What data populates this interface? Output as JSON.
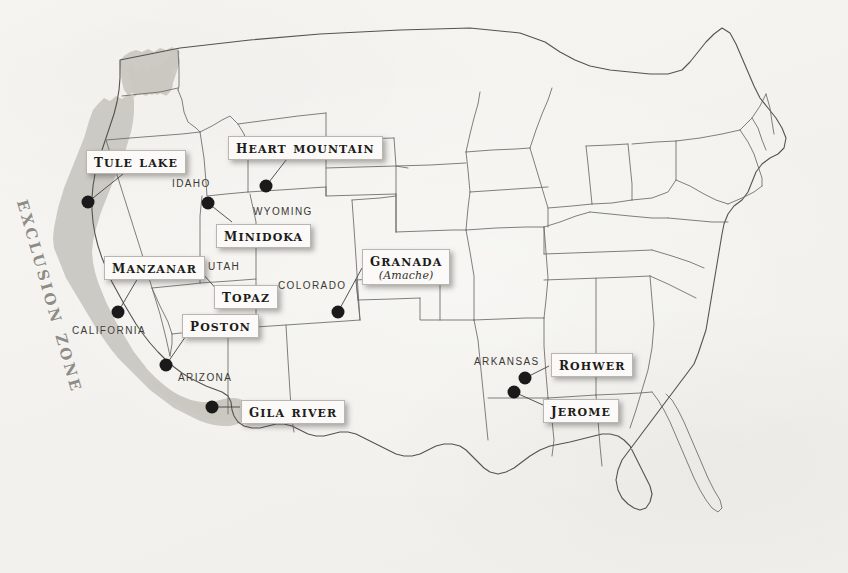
{
  "map": {
    "title": "Japanese American Incarceration Camps and West Coast Exclusion Zone",
    "background_color": "#f5f4f1",
    "outline_color": "#5a5853",
    "zone_fill_color": "#c9c7c1",
    "dot_color": "#1a1a1a",
    "exclusion_zone_label": "Exclusion Zone"
  },
  "camps": [
    {
      "name": "Tule Lake",
      "subtitle": "",
      "label_x": 86,
      "label_y": 150,
      "dot_x": 88,
      "dot_y": 202
    },
    {
      "name": "Heart Mountain",
      "subtitle": "",
      "label_x": 228,
      "label_y": 136,
      "dot_x": 266,
      "dot_y": 186
    },
    {
      "name": "Minidoka",
      "subtitle": "",
      "label_x": 216,
      "label_y": 224,
      "dot_x": 208,
      "dot_y": 203
    },
    {
      "name": "Manzanar",
      "subtitle": "",
      "label_x": 104,
      "label_y": 256,
      "dot_x": 118,
      "dot_y": 312
    },
    {
      "name": "Topaz",
      "subtitle": "",
      "label_x": 214,
      "label_y": 285,
      "dot_x": 195,
      "dot_y": 265
    },
    {
      "name": "Poston",
      "subtitle": "",
      "label_x": 182,
      "label_y": 314,
      "dot_x": 166,
      "dot_y": 365
    },
    {
      "name": "Gila River",
      "subtitle": "",
      "label_x": 241,
      "label_y": 400,
      "dot_x": 212,
      "dot_y": 407
    },
    {
      "name": "Granada",
      "subtitle": "(Amache)",
      "label_x": 362,
      "label_y": 249,
      "dot_x": 338,
      "dot_y": 312
    },
    {
      "name": "Rohwer",
      "subtitle": "",
      "label_x": 551,
      "label_y": 353,
      "dot_x": 525,
      "dot_y": 378
    },
    {
      "name": "Jerome",
      "subtitle": "",
      "label_x": 543,
      "label_y": 399,
      "dot_x": 514,
      "dot_y": 392
    }
  ],
  "states": [
    {
      "name": "IDAHO",
      "x": 172,
      "y": 178
    },
    {
      "name": "WYOMING",
      "x": 253,
      "y": 206
    },
    {
      "name": "UTAH",
      "x": 208,
      "y": 261
    },
    {
      "name": "COLORADO",
      "x": 278,
      "y": 280
    },
    {
      "name": "CALIFORNIA",
      "x": 72,
      "y": 325
    },
    {
      "name": "ARIZONA",
      "x": 178,
      "y": 372
    },
    {
      "name": "ARKANSAS",
      "x": 474,
      "y": 356
    }
  ]
}
